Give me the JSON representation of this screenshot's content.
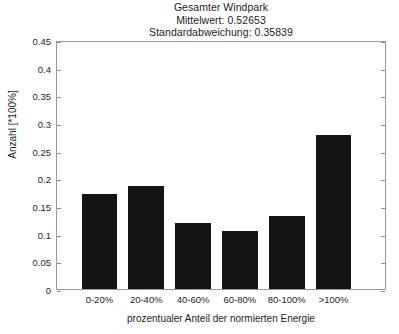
{
  "chart_data": {
    "type": "bar",
    "title": "Gesamter Windpark",
    "title_lines": [
      "Gesamter Windpark",
      "Mittelwert: 0.52653",
      "Standardabweichung: 0.35839"
    ],
    "statistics": {
      "mittelwert_label": "Mittelwert:",
      "mittelwert": 0.52653,
      "standardabweichung_label": "Standardabweichung:",
      "standardabweichung": 0.35839
    },
    "categories": [
      "0-20%",
      "20-40%",
      "40-60%",
      "60-80%",
      "80-100%",
      ">100%"
    ],
    "values": [
      0.172,
      0.187,
      0.119,
      0.105,
      0.132,
      0.278
    ],
    "xlabel": "prozentualer Anteil der normierten Energie",
    "ylabel": "Anzahl [*100%]",
    "ylim": [
      0,
      0.45
    ],
    "yticks": [
      0,
      0.05,
      0.1,
      0.15,
      0.2,
      0.25,
      0.3,
      0.35,
      0.4,
      0.45
    ],
    "ytick_labels": [
      "0",
      "0.05",
      "0.1",
      "0.15",
      "0.2",
      "0.25",
      "0.3",
      "0.35",
      "0.4",
      "0.45"
    ],
    "grid": false,
    "legend": null,
    "bar_color": "#141414",
    "axis_color": "#9a9a9a",
    "background_color": "#ffffff",
    "text_color": "#1d1d1d"
  }
}
